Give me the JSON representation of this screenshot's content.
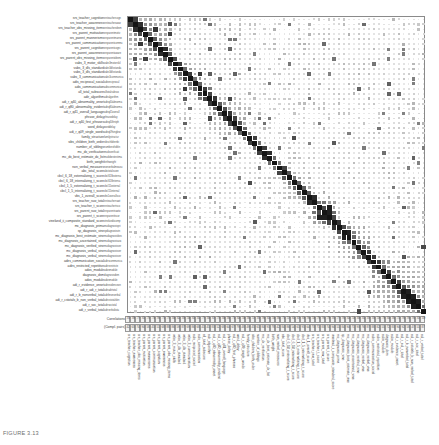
{
  "figure": {
    "caption": "FIGURE 3.13",
    "title": "",
    "legend": {
      "row1_label": "Correlations",
      "row2_label": "(Compl. pairs)"
    }
  },
  "chart_data": {
    "type": "heatmap",
    "title": "",
    "subtitle": "",
    "xlabel": "",
    "ylabel": "",
    "grid": true,
    "legend_position": "bottom-left",
    "colormap": "grayscale",
    "cell_encoding": "size-and-darkness proportional to |correlation|",
    "value_range": [
      -1,
      1
    ],
    "n_variables": 60,
    "variables": [
      "sm_teacher_cognition",
      "sm_teacher_audiences",
      "sm_teacher_obs_missing_items",
      "sm_parent_motivation",
      "sm_parent_mannerisms",
      "sm_parent_communication",
      "sm_parent_cognition",
      "sm_parent_awareness",
      "sm_parent_obs_missing_items",
      "vabs_3_motor_skills",
      "vabs_3_dls_standard",
      "vabs_3_dls_standard_2",
      "vabs_3_communication",
      "adis_reciprocal_social",
      "adis_communication",
      "adi_r_total_subscore",
      "adir_algorithm",
      "adi_r_q40_abnormality_onset",
      "adi_r_q80_abnormality_evident",
      "adi_r_q41_overall_language",
      "phrase_delay",
      "adi_r_q40_first_phrases",
      "word_delay",
      "adi_r_q09_single_words",
      "family_structure",
      "sbs_children_birth_order",
      "number_of_siblings",
      "mc_dx_verification",
      "mc_dx_best_estimate_dx_list",
      "birth_weight",
      "non_verbal_measures",
      "abc_total_score",
      "cbcl_6_18_externalizing_t_score",
      "cbcl_6_18_internalizing_t_score",
      "cbcl_1_5_externalizing_t_score",
      "cbcl_1_5_internalizing_t_score",
      "vbs_1_overall_score",
      "srs_teacher_raw_total",
      "srs_teacher_t_score",
      "srs_parent_raw_total",
      "srs_parent_t_score",
      "vineland_ii_composite_standard_score",
      "mc_diagnosis_prima",
      "sp_diagnosis_vine",
      "mc_diagnosis_best_estimate_vine",
      "mc_diagnosis_ascertained_vine",
      "mc_diagnosis_verified_vine",
      "mc_diagnosis_verbal_vine",
      "mc_diagnosis_verbal_vine_2",
      "adirs_communication_social",
      "adirs_restricted_repetitive",
      "ados_module",
      "diagnosis_dsm",
      "ados_module_2",
      "adi_r_evidence_onset",
      "adi_r_adi_r_total",
      "adi_r_b_nonverbal_total",
      "adi_r_cstotals_b_non_verbal_total",
      "adi_r_soc_total",
      "adi_r_verbal_total"
    ],
    "row_labels": [
      "srs_teacher_cognition",
      "srs_teacher_awareness",
      "srs_teacher_obs_missing_items",
      "srs_parent_motivation",
      "srs_parent_mannerisms",
      "srs_parent_communication",
      "srs_parent_cognition",
      "srs_parent_awareness",
      "srs_parent_obs_missing_items",
      "vabs_3_motor_skills",
      "vabs_3_dls_standard",
      "vabs_3_dls_standard",
      "vabs_3_communication",
      "adis_reciprocal_social",
      "adis_communication",
      "all_total_subscore",
      "adir_algorithm",
      "adi_r_q40_abnormality_onset",
      "adi_r_q80_abnormality_evident",
      "adi_r_q41_overall_language",
      "phrase_delay",
      "adi_r_q40_first_phrases",
      "word_delay",
      "adi_r_q09_single_words",
      "family_structure",
      "sibs_children_birth_order",
      "number_of_siblings",
      "mc_dx_verification",
      "mc_dx_best_estimate_dx_list",
      "birth_weight",
      "non_verbal_measures",
      "abc_total_score",
      "cbcl_6_18_externalizing_t_score",
      "cbcl_6_18_internalizing_t_score",
      "cbcl_1_5_externalizing_t_score",
      "cbcl_1_5_internalizing_t_score",
      "vbs_1_overall_score",
      "srs_teacher_raw_total",
      "srs_teacher_t_score",
      "srs_parent_raw_total",
      "srs_parent_t_score",
      "vineland_ii_composite_standard_score",
      "mc_diagnosis_prima",
      "sp_diagnosis_vine",
      "mc_diagnosis_best_estimate_vine",
      "mc_diagnosis_ascertained_vine",
      "mc_diagnosis_verified_vine",
      "mc_diagnosis_verbal_vine",
      "mc_diagnosis_verbal_vine",
      "adirs_communication_social",
      "adirs_restricted_repetitive",
      "ados_module",
      "diagnosis_dsm",
      "ados_module",
      "adi_r_evidence_onset",
      "adi_r_adi_r_total",
      "adi_r_b_nonverbal_total",
      "adi_r_cstotals_b_non_verbal_total",
      "adi_r_soc_total",
      "adi_r_verbal_total"
    ],
    "column_labels": [
      "srs_teacher_cognition",
      "srs_teacher_awareness",
      "srs_teacher_obs_missing_items",
      "srs_parent_motivation",
      "srs_parent_mannerisms",
      "srs_parent_communication",
      "srs_parent_cognition",
      "srs_parent_awareness",
      "srs_parent_obs_missing_items",
      "vabs_3_motor_skills",
      "vabs_3_dls_standard",
      "vabs_3_dls_standard",
      "vabs_3_communication",
      "adis_reciprocal_social",
      "adis_communication",
      "all_total_subscore",
      "adir_algorithm",
      "adi_r_q40_abnormality_onset",
      "adi_r_q80_abnormality_evident",
      "adi_r_q41_overall_language",
      "phrase_delay",
      "adi_r_q40_first_phrases",
      "word_delay",
      "adi_r_q09_single_words",
      "family_structure",
      "sibs_children_birth_order",
      "number_of_siblings",
      "mc_dx_verification",
      "mc_dx_best_estimate_dx_list",
      "birth_weight",
      "non_verbal_measures",
      "abc_total_score",
      "cbcl_6_18_externalizing_t_score",
      "cbcl_6_18_internalizing_t_score",
      "cbcl_1_5_externalizing_t_score",
      "cbcl_1_5_internalizing_t_score",
      "vbs_1_overall_score",
      "srs_teacher_raw_total",
      "srs_teacher_t_score",
      "srs_parent_raw_total",
      "srs_parent_t_score",
      "vineland_ii_composite_standard_score",
      "mc_diagnosis_prima",
      "sp_diagnosis_vine",
      "mc_diagnosis_best_estimate_vine",
      "mc_diagnosis_ascertained_vine",
      "mc_diagnosis_verified_vine",
      "mc_diagnosis_verbal_vine",
      "mc_diagnosis_verbal_vine",
      "adirs_communication_social",
      "adirs_restricted_repetitive",
      "ados_module",
      "diagnosis_dsm",
      "ados_module",
      "adi_r_evidence_onset",
      "adi_r_adi_r_total",
      "adi_r_b_nonverbal_total",
      "adi_r_cstotals_b_non_verbal_total",
      "adi_r_soc_total",
      "adi_r_verbal_total"
    ],
    "block_structure": [
      {
        "name": "srs-teacher-parent",
        "rows": [
          0,
          8
        ],
        "strength": 0.62
      },
      {
        "name": "vabs-adis",
        "rows": [
          9,
          15
        ],
        "strength": 0.58
      },
      {
        "name": "adir-language-onset",
        "rows": [
          16,
          23
        ],
        "strength": 0.55
      },
      {
        "name": "demographics",
        "rows": [
          24,
          30
        ],
        "strength": 0.25
      },
      {
        "name": "cbcl-abc",
        "rows": [
          31,
          36
        ],
        "strength": 0.5
      },
      {
        "name": "srs-totals",
        "rows": [
          37,
          41
        ],
        "strength": 0.78
      },
      {
        "name": "diagnosis",
        "rows": [
          42,
          48
        ],
        "strength": 0.7
      },
      {
        "name": "adir-totals",
        "rows": [
          49,
          59
        ],
        "strength": 0.66
      }
    ]
  }
}
